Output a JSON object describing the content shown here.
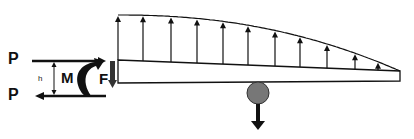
{
  "diagram": {
    "labels": {
      "p_top": "P",
      "p_bottom": "P",
      "h": "h",
      "moment": "M",
      "force": "F"
    },
    "colors": {
      "stroke": "#111111",
      "mass_fill": "#777777",
      "background": "#ffffff"
    },
    "beam": {
      "left_x": 118,
      "right_x": 400,
      "top_left_y": 60,
      "top_right_y": 71,
      "bottom_left_y": 83,
      "bottom_right_y": 81
    },
    "load_envelope": {
      "description": "Distributed upward load, decreasing toward free end",
      "start": [
        118,
        15
      ],
      "end": [
        400,
        71
      ]
    },
    "load_arrows_x": [
      118,
      143,
      171,
      197,
      223,
      248,
      275,
      300,
      327,
      355,
      378
    ],
    "mass": {
      "cx": 258,
      "cy": 93,
      "r": 11,
      "arrow_to_y": 130
    }
  }
}
